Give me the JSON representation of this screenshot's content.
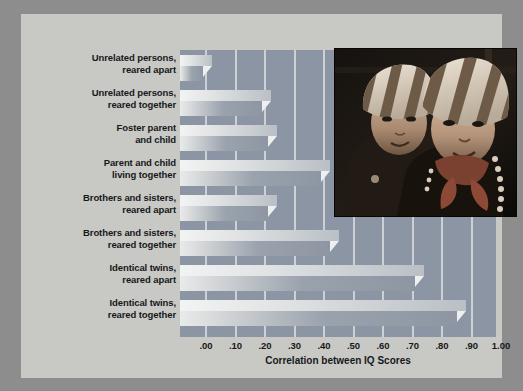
{
  "chart_data": {
    "type": "bar",
    "orientation": "horizontal",
    "title": "",
    "xlabel": "Correlation between IQ Scores",
    "ylabel": "",
    "xlim": [
      0.0,
      1.0
    ],
    "xticks": [
      ".00",
      ".10",
      ".20",
      ".30",
      ".40",
      ".50",
      ".60",
      ".70",
      ".80",
      ".90",
      "1.00"
    ],
    "xtick_values": [
      0.0,
      0.1,
      0.2,
      0.3,
      0.4,
      0.5,
      0.6,
      0.7,
      0.8,
      0.9,
      1.0
    ],
    "grid": true,
    "legend": null,
    "categories": [
      "Unrelated persons, reared apart",
      "Unrelated persons, reared together",
      "Foster parent and child",
      "Parent and child living together",
      "Brothers and sisters, reared apart",
      "Brothers and sisters, reared together",
      "Identical twins, reared apart",
      "Identical twins, reared together"
    ],
    "values": [
      0.02,
      0.22,
      0.24,
      0.42,
      0.24,
      0.45,
      0.74,
      0.88
    ]
  },
  "categories_display": [
    {
      "line1": "Unrelated persons,",
      "line2": "reared apart"
    },
    {
      "line1": "Unrelated persons,",
      "line2": "reared together"
    },
    {
      "line1": "Foster parent",
      "line2": "and child"
    },
    {
      "line1": "Parent and child",
      "line2": "living together"
    },
    {
      "line1": "Brothers and sisters,",
      "line2": "reared apart"
    },
    {
      "line1": "Brothers and sisters,",
      "line2": "reared together"
    },
    {
      "line1": "Identical twins,",
      "line2": "reared apart"
    },
    {
      "line1": "Identical twins,",
      "line2": "reared together"
    }
  ],
  "axis": {
    "xlabel": "Correlation between IQ Scores",
    "ticks": [
      ".00",
      ".10",
      ".20",
      ".30",
      ".40",
      ".50",
      ".60",
      ".70",
      ".80",
      ".90",
      "1.00"
    ]
  },
  "photo": {
    "alt": "two young twin children wearing matching striped knit hats"
  },
  "colors": {
    "page_background": "#8d8d8d",
    "card_background": "#c8c8c4",
    "plot_background": "#8b95a3",
    "gridline": "#d8dade",
    "bar_light": "#eef0f0",
    "bar_dark": "#8d96a2",
    "text": "#16181a"
  }
}
